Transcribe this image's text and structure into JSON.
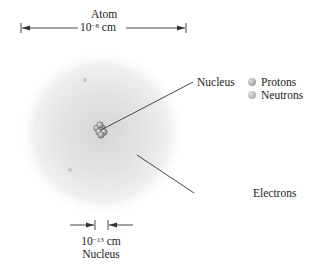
{
  "diagram": {
    "atom": {
      "label": "Atom",
      "size_base": "10",
      "size_exp": "−8",
      "size_unit": "cm"
    },
    "nucleus_scale": {
      "size_base": "10",
      "size_exp": "−13",
      "size_unit": "cm",
      "label": "Nucleus"
    },
    "callouts": {
      "nucleus": "Nucleus",
      "electrons": "Electrons"
    },
    "legend": [
      {
        "label": "Protons",
        "color": "#9a9a9a"
      },
      {
        "label": "Neutrons",
        "color": "#a8a8a8"
      }
    ],
    "colors": {
      "cloud": "#cfcfcf",
      "line": "#333333"
    }
  }
}
